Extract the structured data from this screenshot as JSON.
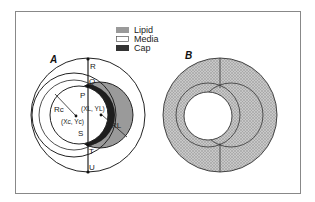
{
  "figure": {
    "panels": [
      {
        "id": "A",
        "label": "A"
      },
      {
        "id": "B",
        "label": "B"
      }
    ],
    "legend": [
      {
        "label": "Lipid",
        "color": "#9a9a9a"
      },
      {
        "label": "Media",
        "color": "#ffffff"
      },
      {
        "label": "Cap",
        "color": "#333333"
      }
    ],
    "point_labels": {
      "R": "R",
      "Q": "Q",
      "P": "P",
      "S": "S",
      "T": "T",
      "U": "U"
    },
    "annotations": {
      "rc": "Rc",
      "rl": "RL",
      "xl": "(XL, YL)",
      "xc": "(Xc, Yc)"
    },
    "colors": {
      "lipid": "#9a9a9a",
      "cap": "#1e1e1e",
      "stipple": "#b5b5b5",
      "line": "#222222",
      "frame": "#888888"
    }
  }
}
